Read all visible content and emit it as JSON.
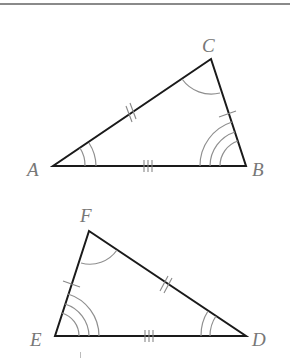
{
  "figure": {
    "type": "congruent-triangles",
    "triangle_top": {
      "vertices": {
        "A": {
          "label": "A",
          "x": 53,
          "y": 166
        },
        "B": {
          "label": "B",
          "x": 246,
          "y": 166
        },
        "C": {
          "label": "C",
          "x": 211,
          "y": 59
        }
      },
      "side_marks": {
        "AB": 3,
        "AC": 2,
        "BC": 1
      },
      "angle_arcs": {
        "A": 2,
        "B": 3,
        "C": 1
      }
    },
    "triangle_bottom": {
      "vertices": {
        "E": {
          "label": "E",
          "x": 55,
          "y": 336
        },
        "D": {
          "label": "D",
          "x": 246,
          "y": 336
        },
        "F": {
          "label": "F",
          "x": 89,
          "y": 231
        }
      },
      "side_marks": {
        "ED": 3,
        "FD": 2,
        "EF": 1
      },
      "angle_arcs": {
        "E": 3,
        "D": 2,
        "F": 1
      }
    },
    "colors": {
      "sides": "#1a1a1a",
      "marks": "#8f8f8f",
      "labels": "#777777",
      "rule": "#8a8a8a"
    }
  }
}
